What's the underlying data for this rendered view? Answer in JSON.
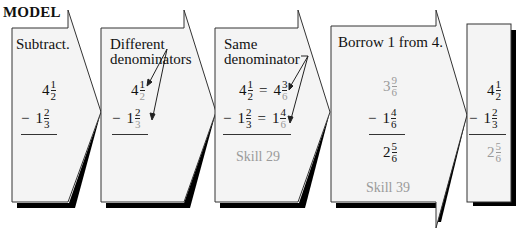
{
  "header": {
    "label": "MODEL"
  },
  "colors": {
    "panel_fill": "#f4f4f4",
    "outline": "#333333",
    "shadow": "#000000",
    "muted_text": "#9a9a9a"
  },
  "panels": [
    {
      "title": "Subtract.",
      "rows": [
        {
          "op": "",
          "whole": "4",
          "num": "1",
          "den": "2"
        },
        {
          "op": "−",
          "whole": "1",
          "num": "2",
          "den": "3"
        }
      ]
    },
    {
      "title_line1": "Different",
      "title_line2": "denominators",
      "rows": [
        {
          "op": "",
          "whole": "4",
          "num": "1",
          "den": "2"
        },
        {
          "op": "−",
          "whole": "1",
          "num": "2",
          "den": "3"
        }
      ]
    },
    {
      "title_line1": "Same",
      "title_line2": "denominator",
      "rows": [
        {
          "op": "",
          "whole": "4",
          "num": "1",
          "den": "2",
          "eq": "=",
          "whole2": "4",
          "num2": "3",
          "den2": "6"
        },
        {
          "op": "−",
          "whole": "1",
          "num": "2",
          "den": "3",
          "eq": "=",
          "whole2": "1",
          "num2": "4",
          "den2": "6"
        }
      ],
      "skill": "Skill 29"
    },
    {
      "title": "Borrow 1 from 4.",
      "rows": [
        {
          "op": "",
          "whole": "3",
          "num": "9",
          "den": "6"
        },
        {
          "op": "−",
          "whole": "1",
          "num": "4",
          "den": "6"
        }
      ],
      "result": {
        "whole": "2",
        "num": "5",
        "den": "6"
      },
      "skill": "Skill 39"
    },
    {
      "rows": [
        {
          "op": "",
          "whole": "4",
          "num": "1",
          "den": "2"
        },
        {
          "op": "−",
          "whole": "1",
          "num": "2",
          "den": "3"
        }
      ],
      "result": {
        "whole": "2",
        "num": "5",
        "den": "6"
      }
    }
  ]
}
